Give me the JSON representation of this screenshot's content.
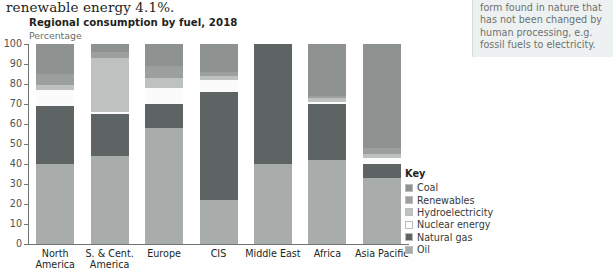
{
  "running_text": "renewable energy 4.1%.",
  "sidenote": {
    "lines": [
      "form found in nature that",
      "has not been changed by",
      "human processing, e.g.",
      "fossil fuels to electricity."
    ]
  },
  "chart_data": {
    "type": "bar",
    "subtype": "stacked-100-percent",
    "title": "Regional consumption by fuel, 2018",
    "subtitle": "Percentage",
    "xlabel": "",
    "ylabel": "Percentage",
    "ylim": [
      0,
      100
    ],
    "yticks": [
      0,
      10,
      20,
      30,
      40,
      50,
      60,
      70,
      80,
      90,
      100
    ],
    "grid": false,
    "legend_position": "right",
    "legend_title": "Key",
    "categories": [
      "North America",
      "S. & Cent. America",
      "Europe",
      "CIS",
      "Middle East",
      "Africa",
      "Asia Pacific"
    ],
    "category_lines": [
      [
        "North",
        "America"
      ],
      [
        "S. & Cent.",
        "America"
      ],
      [
        "Europe",
        ""
      ],
      [
        "CIS",
        ""
      ],
      [
        "Middle East",
        ""
      ],
      [
        "Africa",
        ""
      ],
      [
        "Asia Pacific",
        ""
      ]
    ],
    "series": [
      {
        "name": "Oil",
        "color": "#a8acab",
        "values": [
          40.0,
          44.0,
          58.0,
          22.0,
          40.0,
          42.0,
          33.0
        ]
      },
      {
        "name": "Natural gas",
        "color": "#5d6463",
        "values": [
          29.0,
          21.0,
          12.0,
          54.0,
          60.0,
          28.0,
          7.0
        ]
      },
      {
        "name": "Nuclear energy",
        "color": "#fbfbfb",
        "values": [
          8.0,
          1.0,
          8.0,
          6.0,
          0.0,
          1.0,
          3.0
        ]
      },
      {
        "name": "Hydroelectricity",
        "color": "#bdc1c0",
        "values": [
          2.5,
          27.0,
          5.0,
          2.0,
          0.0,
          2.0,
          2.0
        ]
      },
      {
        "name": "Renewables",
        "color": "#9ba09f",
        "values": [
          5.5,
          3.0,
          6.0,
          2.0,
          0.0,
          1.0,
          3.0
        ]
      },
      {
        "name": "Coal",
        "color": "#8e9392",
        "values": [
          15.0,
          4.0,
          11.0,
          14.0,
          0.0,
          26.0,
          52.0
        ]
      }
    ],
    "legend_items": [
      {
        "label": "Coal",
        "color": "#8e9392"
      },
      {
        "label": "Renewables",
        "color": "#9ba09f"
      },
      {
        "label": "Hydroelectricity",
        "color": "#bdc1c0"
      },
      {
        "label": "Nuclear energy",
        "color": "#fbfbfb"
      },
      {
        "label": "Natural gas",
        "color": "#5d6463"
      },
      {
        "label": "Oil",
        "color": "#a8acab"
      }
    ]
  }
}
